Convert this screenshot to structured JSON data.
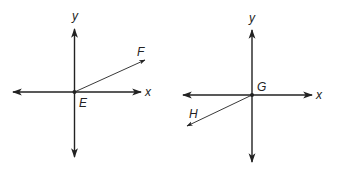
{
  "diagrams": [
    {
      "origin_label": "E",
      "x_axis_label": "x",
      "y_axis_label": "y",
      "ray_label": "F",
      "ray_direction": "up-right (first quadrant)"
    },
    {
      "origin_label": "G",
      "x_axis_label": "x",
      "y_axis_label": "y",
      "ray_label": "H",
      "ray_direction": "down-left (third quadrant)"
    }
  ],
  "colors": {
    "line": "#222222",
    "background": "#ffffff"
  }
}
